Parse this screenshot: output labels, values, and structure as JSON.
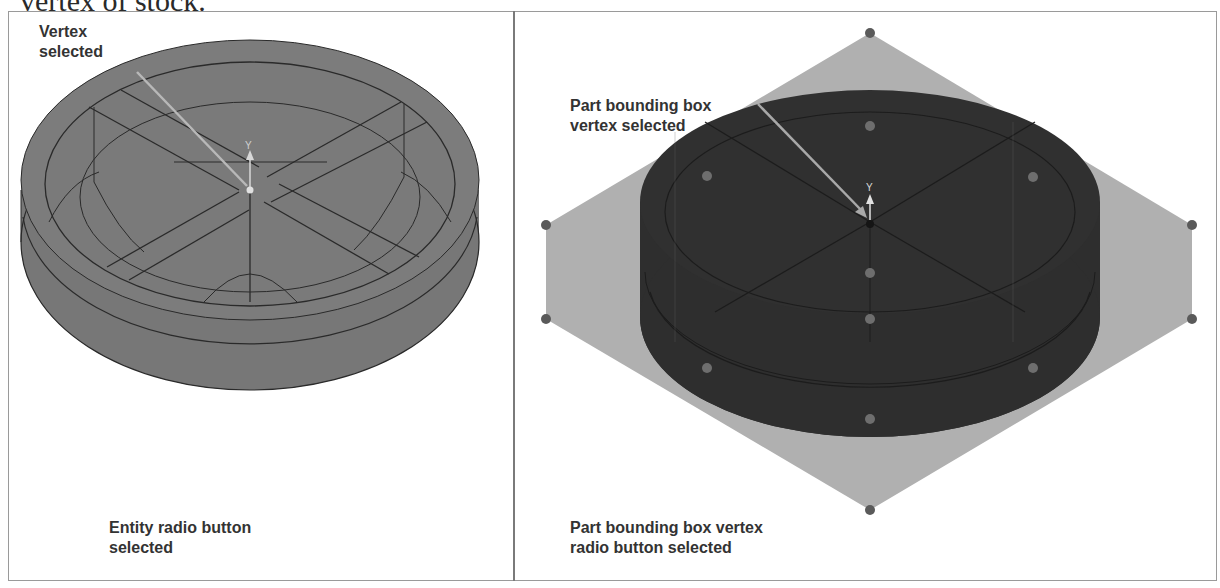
{
  "page": {
    "top_caption": "vertex of stock."
  },
  "left_panel": {
    "callout": "Vertex\nselected",
    "callout_lines": [
      "Vertex",
      "selected"
    ],
    "caption_lines": [
      "Entity radio button",
      "selected"
    ],
    "axis_labels": {
      "y": "Y",
      "x": "X",
      "z": "Z"
    },
    "colors": {
      "part": "#7a7a7a",
      "edge": "#2a2a2a",
      "arrow": "#b8b8b8"
    }
  },
  "right_panel": {
    "callout_lines": [
      "Part bounding box",
      "vertex selected"
    ],
    "caption_lines": [
      "Part bounding box vertex",
      "radio button selected"
    ],
    "axis_labels": {
      "y": "Y"
    },
    "colors": {
      "bounding_box": "#b0b0b0",
      "part": "#2e2e2e",
      "vertex_dot": "#5a5a5a",
      "inner_dot": "#6e6e6e",
      "arrow": "#a8a8a8"
    }
  }
}
